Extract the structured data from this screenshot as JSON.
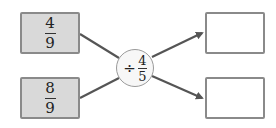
{
  "inputs": [
    {
      "numerator": "4",
      "denominator": "9"
    },
    {
      "numerator": "8",
      "denominator": "9"
    }
  ],
  "operator": {
    "symbol": "÷",
    "numerator": "4",
    "denominator": "5"
  },
  "outputs": [
    {
      "value": ""
    },
    {
      "value": ""
    }
  ],
  "colors": {
    "input_fill": "#d9d9d9",
    "border": "#8a8a8a",
    "line": "#555555"
  }
}
